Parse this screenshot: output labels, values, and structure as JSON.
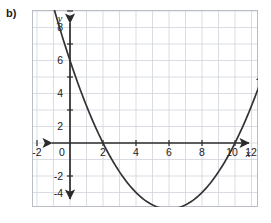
{
  "problem": {
    "label": "b)"
  },
  "chart_data": {
    "type": "line",
    "title": "",
    "subtitle": "",
    "xlabel": "x",
    "ylabel": "y",
    "xlim": [
      -3,
      14
    ],
    "ylim": [
      -5,
      9.5
    ],
    "grid": true,
    "grid_step": 1,
    "legend": "none",
    "x_ticks": [
      -2,
      0,
      2,
      4,
      6,
      8,
      10,
      12
    ],
    "x_tick_labels": [
      "-2",
      "0",
      "2",
      "4",
      "6",
      "8",
      "10",
      "12"
    ],
    "y_ticks": [
      -4,
      -2,
      2,
      4,
      6,
      8
    ],
    "y_tick_labels": [
      "-4",
      "-2",
      "2",
      "4",
      "6",
      "8"
    ],
    "series": [
      {
        "name": "parabola",
        "type": "quadratic",
        "equation": "y = 0.25(x - 2)(x - 10)",
        "a": 0.25,
        "vertex": [
          6,
          -4
        ],
        "x_intercepts": [
          2,
          10
        ],
        "y_intercept": 5,
        "arrows": [
          "left-end",
          "right-end"
        ],
        "color": "#333333",
        "points": [
          [
            -1.0,
            8.25
          ],
          [
            -0.5,
            7.06
          ],
          [
            0.0,
            5.0
          ],
          [
            0.5,
            4.31
          ],
          [
            1.0,
            3.25
          ],
          [
            1.5,
            2.31
          ],
          [
            2.0,
            0.0
          ],
          [
            2.5,
            0.94
          ],
          [
            3.0,
            -1.75
          ],
          [
            3.5,
            -2.31
          ],
          [
            4.0,
            -3.0
          ],
          [
            4.5,
            -3.44
          ],
          [
            5.0,
            -3.75
          ],
          [
            5.5,
            -3.94
          ],
          [
            6.0,
            -4.0
          ],
          [
            6.5,
            -3.94
          ],
          [
            7.0,
            -3.75
          ],
          [
            7.5,
            -3.44
          ],
          [
            8.0,
            -3.0
          ],
          [
            8.5,
            -2.44
          ],
          [
            9.0,
            -1.75
          ],
          [
            9.5,
            -0.94
          ],
          [
            10.0,
            0.0
          ],
          [
            10.5,
            1.06
          ],
          [
            11.0,
            2.25
          ],
          [
            11.5,
            3.56
          ],
          [
            12.0,
            5.0
          ],
          [
            12.5,
            6.56
          ],
          [
            13.0,
            8.25
          ]
        ]
      }
    ]
  },
  "axes": {
    "x_axis_name": "x",
    "y_axis_name": "y",
    "x_arrow_left": true,
    "x_arrow_right": true,
    "y_arrow_up": true,
    "y_arrow_down": true
  },
  "colors": {
    "curve": "#333333",
    "axis": "#2b2b2b",
    "grid": "#cfd4dc",
    "frame": "#b9bec6",
    "text": "#1a1a1a",
    "background": "#ffffff"
  }
}
